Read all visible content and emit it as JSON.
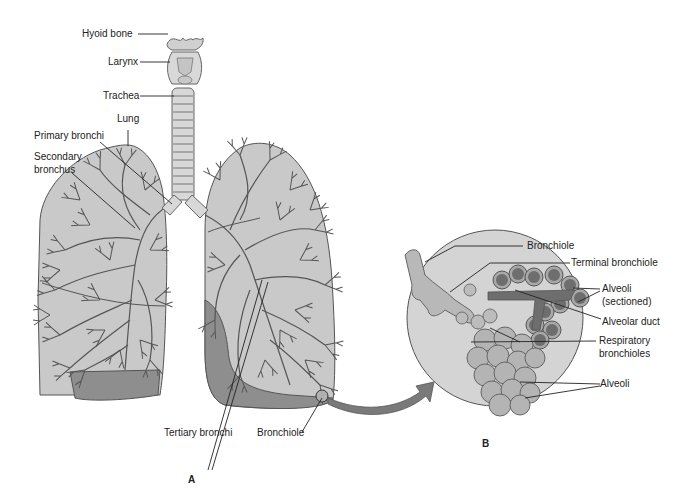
{
  "figure": {
    "panel_a": {
      "letter": "A",
      "labels": {
        "hyoid_bone": "Hyoid bone",
        "larynx": "Larynx",
        "trachea": "Trachea",
        "lung": "Lung",
        "primary_bronchi": "Primary bronchi",
        "secondary_bronchus_1": "Secondary",
        "secondary_bronchus_2": "bronchus",
        "tertiary_bronchi": "Tertiary bronchi",
        "bronchiole": "Bronchiole"
      }
    },
    "panel_b": {
      "letter": "B",
      "labels": {
        "bronchiole": "Bronchiole",
        "terminal_bronchiole": "Terminal bronchiole",
        "alveoli_sectioned_1": "Alveoli",
        "alveoli_sectioned_2": "(sectioned)",
        "alveolar_duct": "Alveolar duct",
        "respiratory_bronchioles_1": "Respiratory",
        "respiratory_bronchioles_2": "bronchioles",
        "alveoli": "Alveoli"
      }
    },
    "colors": {
      "lung_fill": "#c8c8c8",
      "lung_dark": "#8a8a8a",
      "tree_stroke": "#555555",
      "bg_circle": "#d4d4d4",
      "alveoli_fill": "#b8b8b8",
      "alveoli_dark": "#7a7a7a",
      "arrow": "#777777",
      "leader": "#222222"
    }
  }
}
